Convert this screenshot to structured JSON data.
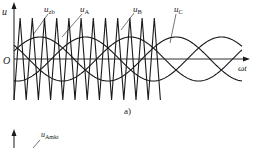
{
  "figure": {
    "panel_label": "a)",
    "y_axis_label": "u",
    "x_axis_label": "ωt",
    "origin_label": "O",
    "curves": [
      {
        "id": "carrier",
        "label_main": "u",
        "label_sub": "zb",
        "kind": "triangle"
      },
      {
        "id": "phaseA",
        "label_main": "u",
        "label_sub": "A",
        "kind": "sine"
      },
      {
        "id": "phaseB",
        "label_main": "u",
        "label_sub": "B",
        "kind": "sine"
      },
      {
        "id": "phaseC",
        "label_main": "u",
        "label_sub": "C",
        "kind": "sine"
      }
    ],
    "second_plot": {
      "label_main": "u",
      "label_sub": "Amkt"
    }
  },
  "chart_data": {
    "type": "line",
    "title": "",
    "xlabel": "ωt",
    "ylabel": "u",
    "caption": "a)",
    "series": [
      {
        "name": "u_zb",
        "shape": "triangle carrier",
        "peaks_visible": 12,
        "amplitude_rel": 1.0
      },
      {
        "name": "u_A",
        "shape": "sine",
        "phase_deg": 0,
        "amplitude_rel": 0.55
      },
      {
        "name": "u_B",
        "shape": "sine",
        "phase_deg": -120,
        "amplitude_rel": 0.55
      },
      {
        "name": "u_C",
        "shape": "sine",
        "phase_deg": 120,
        "amplitude_rel": 0.55
      }
    ],
    "grid": false,
    "legend": "inline leader-line labels"
  },
  "style": {
    "stroke": "#1a1a1a",
    "background": "#ffffff"
  }
}
